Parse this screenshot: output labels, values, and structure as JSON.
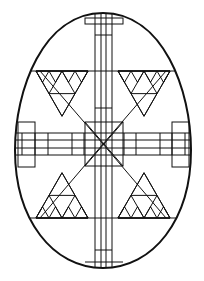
{
  "figure": {
    "line_color": "#111111",
    "background_color": "#ffffff",
    "motifs": [
      "cross-band",
      "sierpinski-triangles",
      "diagonal-star",
      "ladder-bands"
    ]
  }
}
